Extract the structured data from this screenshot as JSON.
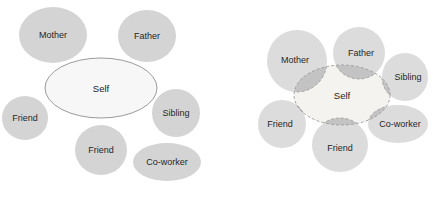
{
  "figure": {
    "background_color": "#ffffff",
    "width": 433,
    "height": 199,
    "node_fill": "#d4d4d4",
    "node_fill_light": "#dcdcdc",
    "self_fill_left": "#f7f7f7",
    "self_fill_right": "#f4f3f0",
    "overlap_fill": "#c3c3c3",
    "outline_color": "#8e8e8e",
    "dashed_outline_color": "#9a9a9a",
    "label_color": "#272727"
  },
  "diagrams": [
    {
      "id": "separate-circles-diagram",
      "name": "non-overlapping-social-network",
      "center": {
        "label": "Self",
        "shape": "ellipse",
        "cx": 101,
        "cy": 88,
        "rx": 56,
        "ry": 30
      },
      "nodes": [
        {
          "label": "Mother",
          "shape": "circle",
          "cx": 53,
          "cy": 35,
          "rx": 34,
          "ry": 28
        },
        {
          "label": "Father",
          "shape": "circle",
          "cx": 147,
          "cy": 36,
          "rx": 29,
          "ry": 26
        },
        {
          "label": "Friend",
          "shape": "circle",
          "cx": 25,
          "cy": 118,
          "rx": 23,
          "ry": 22
        },
        {
          "label": "Sibling",
          "shape": "circle",
          "cx": 176,
          "cy": 113,
          "rx": 24,
          "ry": 24
        },
        {
          "label": "Friend",
          "shape": "circle",
          "cx": 101,
          "cy": 150,
          "rx": 26,
          "ry": 25
        },
        {
          "label": "Co-worker",
          "shape": "ellipse",
          "cx": 167,
          "cy": 162,
          "rx": 34,
          "ry": 19
        }
      ]
    },
    {
      "id": "overlapping-circles-diagram",
      "name": "overlapping-social-network",
      "center": {
        "label": "Self",
        "shape": "ellipse",
        "cx": 342,
        "cy": 95,
        "rx": 48,
        "ry": 30
      },
      "nodes": [
        {
          "label": "Mother",
          "shape": "circle",
          "cx": 297,
          "cy": 61,
          "rx": 30,
          "ry": 31
        },
        {
          "label": "Father",
          "shape": "circle",
          "cx": 359,
          "cy": 53,
          "rx": 26,
          "ry": 26
        },
        {
          "label": "Sibling",
          "shape": "circle",
          "cx": 405,
          "cy": 77,
          "rx": 23,
          "ry": 24
        },
        {
          "label": "Friend",
          "shape": "circle",
          "cx": 282,
          "cy": 124,
          "rx": 24,
          "ry": 24
        },
        {
          "label": "Friend",
          "shape": "circle",
          "cx": 340,
          "cy": 145,
          "rx": 28,
          "ry": 27
        },
        {
          "label": "Co-worker",
          "shape": "ellipse",
          "cx": 398,
          "cy": 124,
          "rx": 30,
          "ry": 19
        }
      ]
    }
  ]
}
